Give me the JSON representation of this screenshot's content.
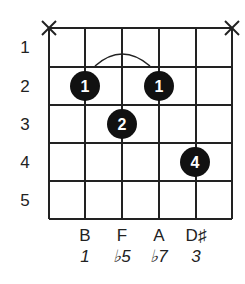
{
  "chord_diagram": {
    "strings": 6,
    "frets_shown": 5,
    "fret_labels": [
      "1",
      "2",
      "3",
      "4",
      "5"
    ],
    "muted_strings": [
      {
        "string": 6,
        "symbol": "X"
      },
      {
        "string": 1,
        "symbol": "X"
      }
    ],
    "barre": {
      "fret": 2,
      "from_string": 5,
      "to_string": 3
    },
    "fingerings": [
      {
        "string": 5,
        "fret": 2,
        "finger": "1"
      },
      {
        "string": 4,
        "fret": 3,
        "finger": "2"
      },
      {
        "string": 3,
        "fret": 2,
        "finger": "1"
      },
      {
        "string": 2,
        "fret": 4,
        "finger": "4"
      }
    ],
    "notes": [
      {
        "string": 5,
        "name": "B",
        "interval": "1"
      },
      {
        "string": 4,
        "name": "F",
        "interval": "♭5"
      },
      {
        "string": 3,
        "name": "A",
        "interval": "♭7"
      },
      {
        "string": 2,
        "name": "D♯",
        "interval": "3"
      }
    ],
    "colors": {
      "line": "#222222",
      "dot": "#111111",
      "dot_text": "#ffffff"
    }
  }
}
